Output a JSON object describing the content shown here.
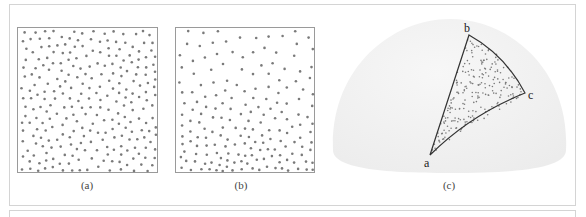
{
  "figure": {
    "panels": [
      {
        "id": "a",
        "caption": "(a)",
        "description": "Uniformly distributed points in a square",
        "distribution": "uniform",
        "point_count": 260
      },
      {
        "id": "b",
        "caption": "(b)",
        "description": "Points in a square with density increasing toward the bottom",
        "distribution": "graded",
        "point_count": 300
      },
      {
        "id": "c",
        "caption": "(c)",
        "description": "Hemisphere with stratified points inside a spherical triangle",
        "distribution": "spherical-triangle",
        "point_count": 220
      }
    ],
    "spherical_triangle": {
      "vertices": [
        {
          "label": "a",
          "x": 110,
          "y": 145
        },
        {
          "label": "b",
          "x": 149,
          "y": 25
        },
        {
          "label": "c",
          "x": 205,
          "y": 83
        }
      ]
    }
  },
  "colors": {
    "frame": "#d4d4d4",
    "box_border": "#9a9a9a",
    "dot": "#7a7a7a",
    "dome_fill": "#f1f1f1",
    "edge": "#333333"
  }
}
